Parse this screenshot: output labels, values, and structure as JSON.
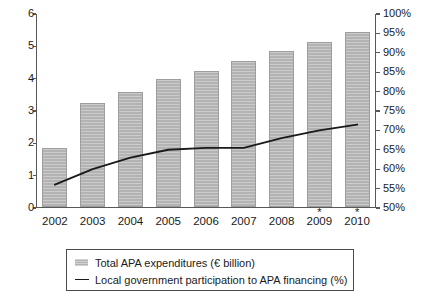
{
  "chart_data": {
    "type": "bar",
    "title": "",
    "xlabel": "",
    "categories": [
      "2002",
      "2003",
      "2004",
      "2005",
      "2006",
      "2007",
      "2008",
      "2009",
      "2010"
    ],
    "category_markers": [
      "",
      "",
      "",
      "",
      "",
      "",
      "",
      "*",
      "*"
    ],
    "grid": false,
    "legend_position": "bottom",
    "series": [
      {
        "name": "Total APA expenditures (€ billion)",
        "type": "bar",
        "axis": "left",
        "values": [
          1.8,
          3.2,
          3.55,
          3.95,
          4.2,
          4.5,
          4.8,
          5.1,
          5.4
        ],
        "color": "#b3b3b3"
      },
      {
        "name": "Local government participation to APA financing (%)",
        "type": "line",
        "axis": "right",
        "values": [
          56,
          60,
          63,
          65,
          65.5,
          65.5,
          68,
          70,
          71.5
        ],
        "color": "#1a1a1a"
      }
    ],
    "axes": {
      "left": {
        "label": "",
        "ylim": [
          0,
          6
        ],
        "ticks": [
          0,
          1,
          2,
          3,
          4,
          5,
          6
        ],
        "tick_labels": [
          "0",
          "1",
          "2",
          "3",
          "4",
          "5",
          "6"
        ]
      },
      "right": {
        "label": "",
        "ylim": [
          50,
          100
        ],
        "ticks": [
          50,
          55,
          60,
          65,
          70,
          75,
          80,
          85,
          90,
          95,
          100
        ],
        "tick_labels": [
          "50%",
          "55%",
          "60%",
          "65%",
          "70%",
          "75%",
          "80%",
          "85%",
          "90%",
          "95%",
          "100%"
        ]
      }
    }
  },
  "legend": {
    "entries": [
      {
        "label": "Total APA expenditures (€ billion)",
        "marker": "bar-swatch"
      },
      {
        "label": "Local government participation to APA financing (%)",
        "marker": "line-swatch"
      }
    ]
  }
}
